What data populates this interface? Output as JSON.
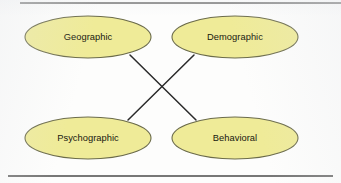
{
  "figure": {
    "background_color": "#fdfdfc",
    "node_fill_color": "#efeb98",
    "node_stroke_color": "#6b6b4a",
    "connector_color": "#2a2a2a",
    "rule_color": "#4a4a4a",
    "rules": [
      {
        "name": "top-rule",
        "y": 3
      },
      {
        "name": "bottom-rule",
        "y": 176
      }
    ],
    "nodes": [
      {
        "id": "geographic",
        "label": "Geographic",
        "cx": 88,
        "cy": 37,
        "rx": 63,
        "ry": 21
      },
      {
        "id": "demographic",
        "label": "Demographic",
        "cx": 235,
        "cy": 37,
        "rx": 63,
        "ry": 21
      },
      {
        "id": "psychographic",
        "label": "Psychographic",
        "cx": 88,
        "cy": 138,
        "rx": 63,
        "ry": 21
      },
      {
        "id": "behavioral",
        "label": "Behavioral",
        "cx": 235,
        "cy": 138,
        "rx": 63,
        "ry": 21
      }
    ],
    "connectors": [
      {
        "id": "geographic-behavioral",
        "from": "geographic",
        "to": "behavioral",
        "x1": 130,
        "y1": 55,
        "x2": 196,
        "y2": 120
      },
      {
        "id": "demographic-psychographic",
        "from": "demographic",
        "to": "psychographic",
        "x1": 194,
        "y1": 55,
        "x2": 128,
        "y2": 120
      }
    ]
  }
}
